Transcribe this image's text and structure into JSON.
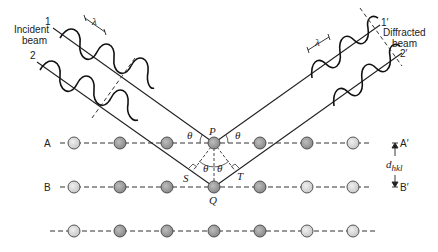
{
  "diagram": {
    "labels": {
      "incident_beam_line1": "Incident",
      "incident_beam_line2": "beam",
      "diffracted_beam_line1": "Diffracted",
      "diffracted_beam_line2": "beam",
      "ray1_in": "1",
      "ray2_in": "2",
      "ray1_out": "1′",
      "ray2_out": "2′",
      "wavelength": "λ",
      "plane_A": "A",
      "plane_A_prime": "A′",
      "plane_B": "B",
      "plane_B_prime": "B′",
      "point_P": "P",
      "point_Q": "Q",
      "point_S": "S",
      "point_T": "T",
      "theta": "θ",
      "spacing": "d",
      "spacing_sub": "hkl"
    },
    "rows": [
      {
        "name": "A",
        "y": 143,
        "atoms": [
          74,
          120,
          167,
          214,
          260,
          307,
          353
        ]
      },
      {
        "name": "B",
        "y": 187,
        "atoms": [
          74,
          120,
          167,
          214,
          260,
          307,
          353
        ]
      },
      {
        "name": "C",
        "y": 231,
        "atoms": [
          74,
          120,
          167,
          214,
          260,
          307,
          353
        ]
      }
    ],
    "colors": {
      "line": "#222222",
      "atom_light": "#d8d8d8",
      "atom_dark": "#9a9a9a"
    }
  }
}
